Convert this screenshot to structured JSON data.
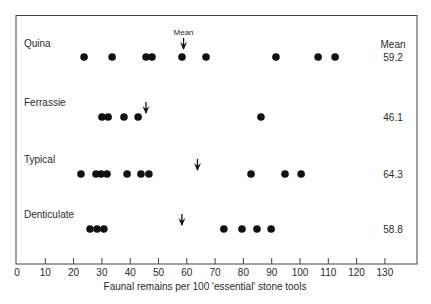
{
  "chart_data": {
    "type": "scatter",
    "title": "",
    "xlabel": "Faunal remains per 100  'essential' stone tools",
    "ylabel": "",
    "xlim": [
      0,
      130
    ],
    "xticks": [
      0,
      10,
      20,
      30,
      40,
      50,
      60,
      70,
      80,
      90,
      100,
      110,
      120,
      130
    ],
    "grid": false,
    "mean_header": "Mean",
    "mean_arrow_label": "Mean",
    "series": [
      {
        "name": "Quina",
        "values": [
          23.7,
          33.6,
          45.6,
          47.7,
          58.3,
          66.8,
          91.5,
          106.4,
          112.4
        ],
        "mean": 59.2,
        "mean_label": "59.2"
      },
      {
        "name": "Ferrassie",
        "values": [
          30.0,
          32.2,
          37.8,
          42.8,
          86.2
        ],
        "mean": 46.1,
        "mean_label": "46.1"
      },
      {
        "name": "Typical",
        "values": [
          22.6,
          27.9,
          29.7,
          31.8,
          38.9,
          43.8,
          46.6,
          82.7,
          94.7,
          100.4
        ],
        "mean": 64.3,
        "mean_label": "64.3"
      },
      {
        "name": "Denticulate",
        "values": [
          25.8,
          28.3,
          30.7,
          73.1,
          79.5,
          84.8,
          89.8
        ],
        "mean": 58.8,
        "mean_label": "58.8"
      }
    ]
  }
}
